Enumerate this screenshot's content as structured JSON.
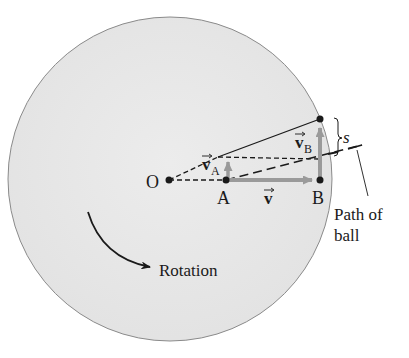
{
  "diagram": {
    "type": "rotating-disk-coriolis",
    "colors": {
      "disk_fill": "#e8e8e8",
      "disk_stroke": "#8a8a8a",
      "line": "#1a1a1a",
      "vector_gray": "#9a9a9a"
    },
    "labels": {
      "origin": "O",
      "point_a": "A",
      "point_b": "B",
      "velocity": "v",
      "velocity_a": "v",
      "velocity_a_sub": "A",
      "velocity_b": "v",
      "velocity_b_sub": "B",
      "deflection": "s",
      "path_line1": "Path of",
      "path_line2": "ball",
      "rotation": "Rotation"
    }
  }
}
